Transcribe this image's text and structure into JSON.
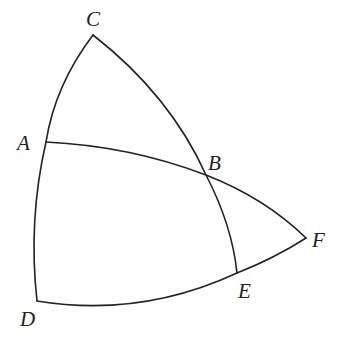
{
  "diagram": {
    "type": "spherical-geometry",
    "stroke_color": "#222222",
    "background": "#ffffff",
    "points": {
      "A": {
        "label": "A",
        "x": 46,
        "y": 142,
        "label_x": 17,
        "label_y": 150
      },
      "B": {
        "label": "B",
        "x": 206,
        "y": 175,
        "label_x": 208,
        "label_y": 170
      },
      "C": {
        "label": "C",
        "x": 93,
        "y": 35,
        "label_x": 86,
        "label_y": 26
      },
      "D": {
        "label": "D",
        "x": 37,
        "y": 301,
        "label_x": 20,
        "label_y": 326
      },
      "E": {
        "label": "E",
        "x": 237,
        "y": 273,
        "label_x": 238,
        "label_y": 298
      },
      "F": {
        "label": "F",
        "x": 306,
        "y": 238,
        "label_x": 312,
        "label_y": 247
      }
    },
    "arcs": [
      {
        "name": "arc-C-A-D",
        "from": "C",
        "via": "A",
        "to": "D"
      },
      {
        "name": "arc-C-B-E",
        "from": "C",
        "via": "B",
        "to": "E"
      },
      {
        "name": "arc-A-B-F",
        "from": "A",
        "via": "B",
        "to": "F"
      },
      {
        "name": "arc-D-E-F",
        "from": "D",
        "via": "E",
        "to": "F"
      }
    ]
  }
}
